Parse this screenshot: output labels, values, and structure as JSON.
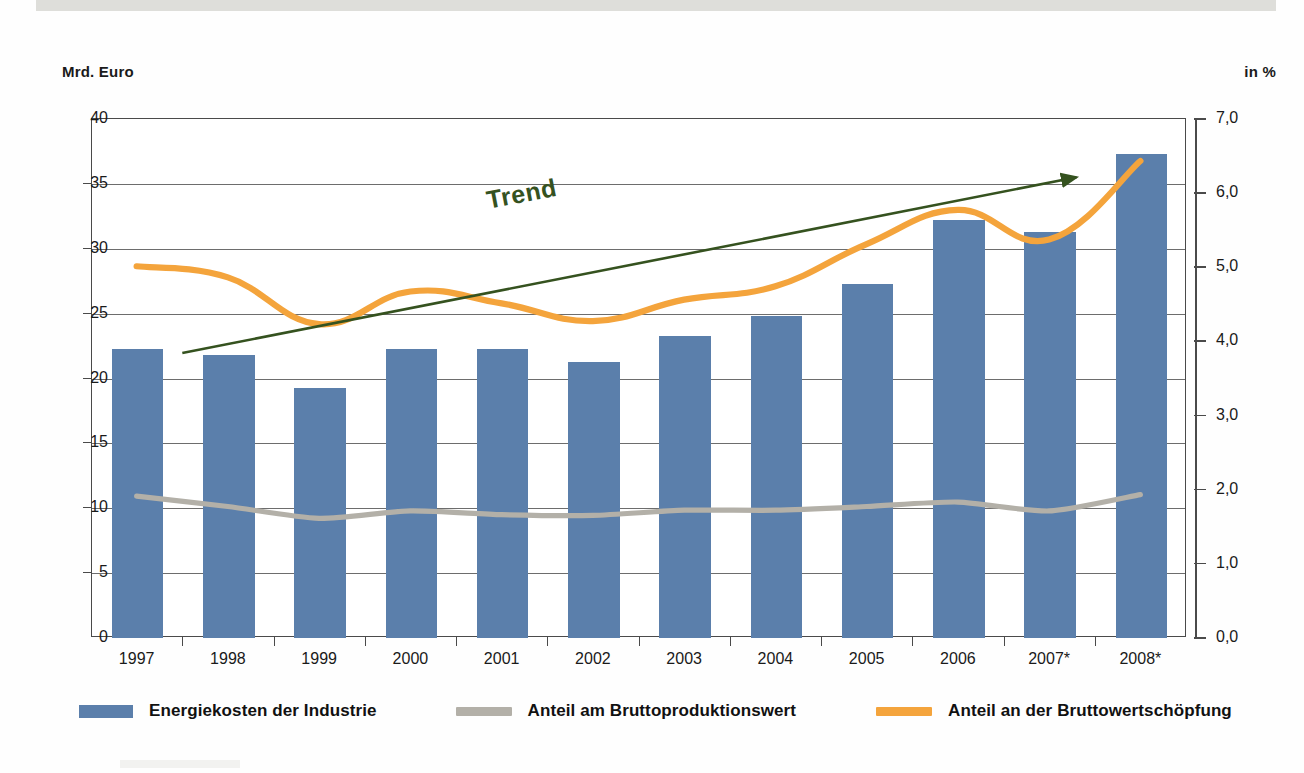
{
  "axes": {
    "left_unit": "Mrd. Euro",
    "right_unit": "in %",
    "left_ticks": [
      "40",
      "35",
      "30",
      "25",
      "20",
      "15",
      "10",
      "5",
      "0"
    ],
    "right_ticks": [
      "7,0",
      "6,0",
      "5,0",
      "4,0",
      "3,0",
      "2,0",
      "1,0",
      "0,0"
    ]
  },
  "annotation": {
    "trend_label": "Trend"
  },
  "legend": {
    "items": [
      {
        "label": "Energiekosten der Industrie",
        "color": "#5b7fab",
        "kind": "bar"
      },
      {
        "label": "Anteil am Bruttoproduktionswert",
        "color": "#b3b0a8",
        "kind": "line"
      },
      {
        "label": "Anteil an der Bruttowertschöpfung",
        "color": "#f4a43c",
        "kind": "line"
      }
    ]
  },
  "colors": {
    "bar": "#5b7fab",
    "gray_line": "#b3b0a8",
    "orange_line": "#f4a43c",
    "trend_arrow": "#35521f",
    "grid": "#6d6d6d",
    "axis": "#4a4a4a"
  },
  "chart_data": {
    "type": "bar",
    "title": "",
    "xlabel": "",
    "ylabel": "Mrd. Euro",
    "y2label": "in %",
    "ylim": [
      0,
      40
    ],
    "y2lim": [
      0.0,
      7.0
    ],
    "grid": true,
    "legend_position": "bottom",
    "categories": [
      "1997",
      "1998",
      "1999",
      "2000",
      "2001",
      "2002",
      "2003",
      "2004",
      "2005",
      "2006",
      "2007*",
      "2008*"
    ],
    "series": [
      {
        "name": "Energiekosten der Industrie",
        "type": "bar",
        "axis": "left",
        "unit": "Mrd. Euro",
        "color": "#5b7fab",
        "values": [
          22.3,
          21.8,
          19.3,
          22.3,
          22.3,
          21.3,
          23.3,
          24.8,
          27.3,
          32.2,
          31.3,
          37.3
        ]
      },
      {
        "name": "Anteil am Bruttoproduktionswert",
        "type": "line",
        "axis": "right",
        "unit": "%",
        "color": "#b3b0a8",
        "values": [
          1.9,
          1.76,
          1.6,
          1.7,
          1.65,
          1.64,
          1.71,
          1.71,
          1.76,
          1.82,
          1.7,
          1.92
        ]
      },
      {
        "name": "Anteil an der Bruttowertschöpfung",
        "type": "line",
        "axis": "right",
        "unit": "%",
        "color": "#f4a43c",
        "values": [
          5.0,
          4.85,
          4.22,
          4.66,
          4.5,
          4.26,
          4.55,
          4.73,
          5.3,
          5.76,
          5.36,
          6.42
        ]
      }
    ],
    "annotations": [
      {
        "text": "Trend",
        "type": "arrow",
        "color": "#35521f",
        "from": [
          "1997.5",
          3.83
        ],
        "to": [
          "2007.3",
          6.2
        ]
      }
    ]
  }
}
